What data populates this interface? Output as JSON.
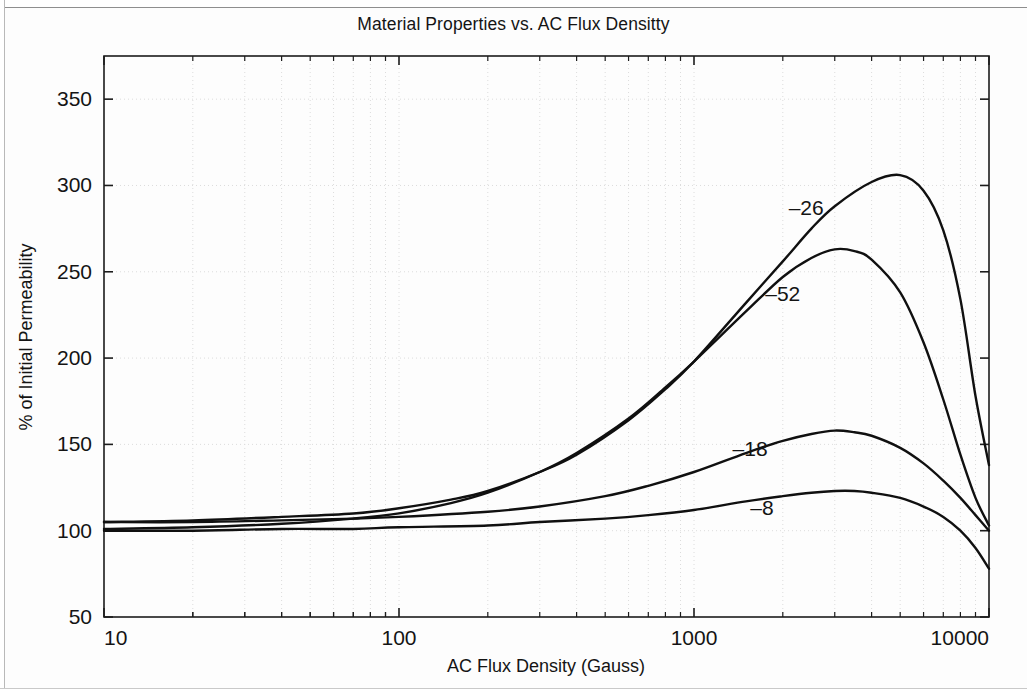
{
  "figure": {
    "title": "Material Properties vs. AC Flux Densitty"
  },
  "axes": {
    "x_title": "AC Flux Density (Gauss)",
    "y_title": "% of Initial Permeability",
    "x_ticks": [
      "10",
      "100",
      "1000",
      "10000"
    ],
    "y_ticks": [
      "50",
      "100",
      "150",
      "200",
      "250",
      "300",
      "350"
    ]
  },
  "chart_data": {
    "type": "line",
    "title": "Material Properties vs. AC Flux Densitty",
    "xlabel": "AC Flux Density (Gauss)",
    "ylabel": "% of Initial Permeability",
    "xscale": "log",
    "yscale": "linear",
    "xlim": [
      10,
      10000
    ],
    "ylim": [
      50,
      375
    ],
    "xtick_values": [
      10,
      100,
      1000,
      10000
    ],
    "ytick_values": [
      50,
      100,
      150,
      200,
      250,
      300,
      350
    ],
    "grid": "dotted-both-axes",
    "legend": "inline-curve-labels",
    "series": [
      {
        "name": "-26",
        "label": "–26",
        "label_x": 2400,
        "label_y": 283,
        "x": [
          10,
          20,
          40,
          70,
          100,
          150,
          200,
          300,
          400,
          600,
          800,
          1000,
          1500,
          2000,
          2500,
          3000,
          4000,
          5000,
          6000,
          7000,
          8000,
          9000,
          10000
        ],
        "y": [
          105,
          106,
          108,
          110,
          113,
          118,
          123,
          134,
          144,
          164,
          182,
          198,
          232,
          256,
          275,
          288,
          302,
          306,
          297,
          274,
          234,
          178,
          138
        ]
      },
      {
        "name": "-52",
        "label": "–52",
        "label_x": 2000,
        "label_y": 233,
        "x": [
          10,
          20,
          40,
          70,
          100,
          150,
          200,
          300,
          400,
          600,
          800,
          1000,
          1500,
          2000,
          2500,
          3000,
          3500,
          4000,
          5000,
          6000,
          7000,
          8000,
          9000,
          10000
        ],
        "y": [
          101,
          102,
          104,
          107,
          110,
          116,
          122,
          134,
          145,
          165,
          183,
          198,
          227,
          247,
          258,
          263,
          262,
          257,
          238,
          209,
          176,
          144,
          119,
          103
        ]
      },
      {
        "name": "-18",
        "label": "–18",
        "label_x": 1550,
        "label_y": 143,
        "x": [
          10,
          20,
          40,
          70,
          100,
          200,
          300,
          500,
          700,
          1000,
          1500,
          2000,
          2500,
          3000,
          3500,
          4000,
          5000,
          6000,
          7000,
          8000,
          9000,
          10000
        ],
        "y": [
          105,
          105,
          106,
          107,
          108,
          111,
          114,
          120,
          126,
          134,
          145,
          152,
          156,
          158,
          157,
          155,
          148,
          139,
          129,
          119,
          109,
          100
        ]
      },
      {
        "name": "-8",
        "label": "–8",
        "label_x": 1700,
        "label_y": 109,
        "x": [
          10,
          20,
          40,
          70,
          100,
          200,
          300,
          500,
          700,
          1000,
          1500,
          2000,
          2500,
          3000,
          3500,
          4000,
          5000,
          6000,
          7000,
          8000,
          9000,
          10000
        ],
        "y": [
          100,
          100,
          101,
          101,
          102,
          103,
          105,
          107,
          109,
          112,
          117,
          120,
          122,
          123,
          123,
          122,
          119,
          114,
          108,
          100,
          90,
          78
        ]
      }
    ]
  }
}
